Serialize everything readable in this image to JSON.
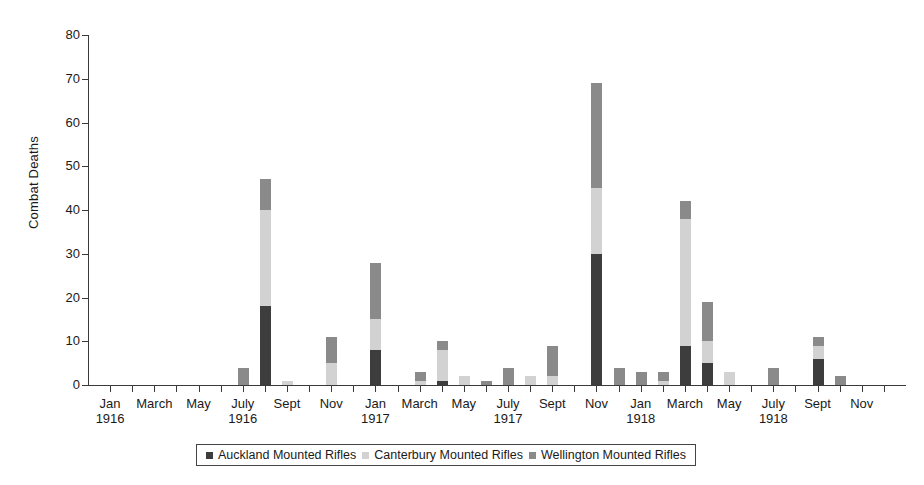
{
  "chart_data": {
    "type": "bar",
    "title": "",
    "subtitle": "",
    "xlabel": "",
    "ylabel": "Combat Deaths",
    "ylim": [
      0,
      80
    ],
    "yticks": [
      0,
      10,
      20,
      30,
      40,
      50,
      60,
      70,
      80
    ],
    "grid": false,
    "stacked": true,
    "legend_position": "bottom",
    "legend_entries": [
      "Auckland Mounted Rifles",
      "Canterbury Mounted Rifles",
      "Wellington Mounted Rifles"
    ],
    "colors": {
      "auckland": "#3d3d3d",
      "canterbury": "#d2d2d2",
      "wellington": "#8a8a8a",
      "axis": "#3a3a3a",
      "background": "#ffffff"
    },
    "axis_tick_labels": [
      {
        "month": "Jan",
        "year": "1916"
      },
      {
        "month": "March",
        "year": ""
      },
      {
        "month": "May",
        "year": ""
      },
      {
        "month": "July",
        "year": "1916"
      },
      {
        "month": "Sept",
        "year": ""
      },
      {
        "month": "Nov",
        "year": ""
      },
      {
        "month": "Jan",
        "year": "1917"
      },
      {
        "month": "March",
        "year": ""
      },
      {
        "month": "May",
        "year": ""
      },
      {
        "month": "July",
        "year": "1917"
      },
      {
        "month": "Sept",
        "year": ""
      },
      {
        "month": "Nov",
        "year": ""
      },
      {
        "month": "Jan",
        "year": "1918"
      },
      {
        "month": "March",
        "year": ""
      },
      {
        "month": "May",
        "year": ""
      },
      {
        "month": "July",
        "year": "1918"
      },
      {
        "month": "Sept",
        "year": ""
      },
      {
        "month": "Nov",
        "year": ""
      }
    ],
    "categories": [
      "Jan 1916",
      "Feb 1916",
      "March 1916",
      "April 1916",
      "May 1916",
      "June 1916",
      "July 1916",
      "Aug 1916",
      "Sept 1916",
      "Oct 1916",
      "Nov 1916",
      "Dec 1916",
      "Jan 1917",
      "Feb 1917",
      "March 1917",
      "April 1917",
      "May 1917",
      "June 1917",
      "July 1917",
      "Aug 1917",
      "Sept 1917",
      "Oct 1917",
      "Nov 1917",
      "Dec 1917",
      "Jan 1918",
      "Feb 1918",
      "March 1918",
      "April 1918",
      "May 1918",
      "June 1918",
      "July 1918",
      "Aug 1918",
      "Sept 1918",
      "Oct 1918",
      "Nov 1918",
      "Dec 1918"
    ],
    "series": [
      {
        "name": "Auckland Mounted Rifles",
        "key": "auckland",
        "color": "#3d3d3d",
        "values": [
          0,
          0,
          0,
          0,
          0,
          0,
          0,
          18,
          0,
          0,
          0,
          0,
          8,
          0,
          0,
          1,
          0,
          0,
          0,
          0,
          0,
          0,
          30,
          0,
          0,
          0,
          9,
          5,
          0,
          0,
          0,
          0,
          6,
          0,
          0,
          0
        ]
      },
      {
        "name": "Canterbury Mounted Rifles",
        "key": "canterbury",
        "color": "#d2d2d2",
        "values": [
          0,
          0,
          0,
          0,
          0,
          0,
          0,
          22,
          1,
          0,
          5,
          0,
          7,
          0,
          1,
          7,
          2,
          0,
          0,
          2,
          2,
          0,
          15,
          0,
          0,
          1,
          29,
          5,
          3,
          0,
          0,
          0,
          3,
          0,
          0,
          0
        ]
      },
      {
        "name": "Wellington Mounted Rifles",
        "key": "wellington",
        "color": "#8a8a8a",
        "values": [
          0,
          0,
          0,
          0,
          0,
          0,
          4,
          7,
          0,
          0,
          6,
          0,
          13,
          0,
          2,
          2,
          0,
          1,
          4,
          0,
          7,
          0,
          24,
          4,
          3,
          2,
          4,
          9,
          0,
          0,
          4,
          0,
          2,
          2,
          0,
          0
        ]
      }
    ],
    "totals": [
      0,
      0,
      0,
      0,
      0,
      0,
      4,
      47,
      1,
      0,
      11,
      0,
      28,
      0,
      3,
      10,
      2,
      1,
      4,
      2,
      9,
      0,
      69,
      4,
      3,
      3,
      42,
      19,
      3,
      0,
      4,
      0,
      11,
      2,
      0,
      0
    ]
  }
}
